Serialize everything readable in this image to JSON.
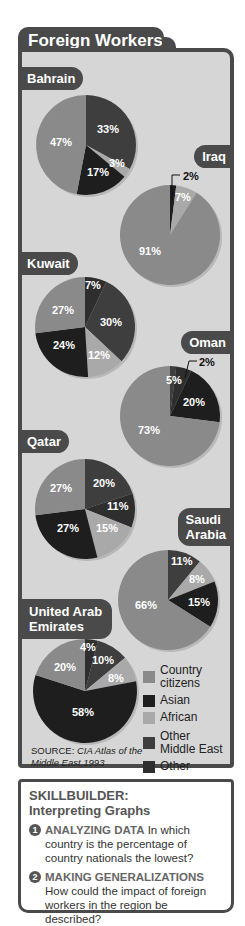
{
  "title": "Foreign Workers",
  "colors": {
    "Country citizens": "#8a8a8a",
    "Asian": "#1e1e1e",
    "African": "#a9a9a9",
    "Other Middle East": "#3e3e3e",
    "Other": "#2e2e2e",
    "panel_bg": "#d6d6d6",
    "tab_bg": "#4a4a4a"
  },
  "countries": {
    "bahrain": "Bahrain",
    "iraq": "Iraq",
    "kuwait": "Kuwait",
    "oman": "Oman",
    "qatar": "Qatar",
    "saudi_line1": "Saudi",
    "saudi_line2": "Arabia",
    "uae_line1": "United Arab",
    "uae_line2": "Emirates"
  },
  "labels": {
    "bahrain": [
      "33%",
      "3%",
      "17%",
      "47%"
    ],
    "iraq": [
      "2%",
      "7%",
      "91%"
    ],
    "kuwait": [
      "7%",
      "30%",
      "12%",
      "24%",
      "27%"
    ],
    "oman": [
      "2%",
      "5%",
      "20%",
      "73%"
    ],
    "qatar": [
      "20%",
      "11%",
      "15%",
      "27%",
      "27%"
    ],
    "saudi": [
      "11%",
      "8%",
      "15%",
      "66%"
    ],
    "uae": [
      "4%",
      "10%",
      "8%",
      "58%",
      "20%"
    ]
  },
  "legend": {
    "items": [
      "Country citizens",
      "Asian",
      "African",
      "Other Middle East",
      "Other"
    ],
    "l0a": "Country",
    "l0b": "citizens",
    "l1": "Asian",
    "l2": "African",
    "l3a": "Other",
    "l3b": "Middle East",
    "l4": "Other"
  },
  "source": {
    "prefix": "SOURCE: ",
    "title": "CIA Atlas of the Middle East,",
    "year": "1993"
  },
  "skillbuilder": {
    "heading1": "SKILLBUILDER:",
    "heading2": "Interpreting Graphs",
    "q1_num": "1",
    "q1_skill": "ANALYZING DATA",
    "q1_text": "In which country is the percentage of country nationals the lowest?",
    "q2_num": "2",
    "q2_skill": "MAKING GENERALIZATIONS",
    "q2_text": "How could the impact of foreign workers in the region be described?"
  },
  "chart_data": {
    "type": "pie",
    "title": "Foreign Workers",
    "legend": [
      "Country citizens",
      "Asian",
      "African",
      "Other Middle East",
      "Other"
    ],
    "source": "CIA Atlas of the Middle East, 1993",
    "charts": [
      {
        "country": "Bahrain",
        "slices": [
          {
            "category": "Other Middle East",
            "value": 33
          },
          {
            "category": "African",
            "value": 3
          },
          {
            "category": "Asian",
            "value": 17
          },
          {
            "category": "Country citizens",
            "value": 47
          }
        ]
      },
      {
        "country": "Iraq",
        "slices": [
          {
            "category": "Asian",
            "value": 2
          },
          {
            "category": "African",
            "value": 7
          },
          {
            "category": "Country citizens",
            "value": 91
          }
        ]
      },
      {
        "country": "Kuwait",
        "slices": [
          {
            "category": "Other",
            "value": 7
          },
          {
            "category": "Other Middle East",
            "value": 30
          },
          {
            "category": "African",
            "value": 12
          },
          {
            "category": "Asian",
            "value": 24
          },
          {
            "category": "Country citizens",
            "value": 27
          }
        ]
      },
      {
        "country": "Oman",
        "slices": [
          {
            "category": "Other Middle East",
            "value": 2
          },
          {
            "category": "Other",
            "value": 5
          },
          {
            "category": "Asian",
            "value": 20
          },
          {
            "category": "Country citizens",
            "value": 73
          }
        ]
      },
      {
        "country": "Qatar",
        "slices": [
          {
            "category": "Other Middle East",
            "value": 20
          },
          {
            "category": "Other",
            "value": 11
          },
          {
            "category": "African",
            "value": 15
          },
          {
            "category": "Asian",
            "value": 27
          },
          {
            "category": "Country citizens",
            "value": 27
          }
        ]
      },
      {
        "country": "Saudi Arabia",
        "slices": [
          {
            "category": "Other Middle East",
            "value": 11
          },
          {
            "category": "African",
            "value": 8
          },
          {
            "category": "Asian",
            "value": 15
          },
          {
            "category": "Country citizens",
            "value": 66
          }
        ]
      },
      {
        "country": "United Arab Emirates",
        "slices": [
          {
            "category": "Other",
            "value": 4
          },
          {
            "category": "Other Middle East",
            "value": 10
          },
          {
            "category": "African",
            "value": 8
          },
          {
            "category": "Asian",
            "value": 58
          },
          {
            "category": "Country citizens",
            "value": 20
          }
        ]
      }
    ]
  }
}
